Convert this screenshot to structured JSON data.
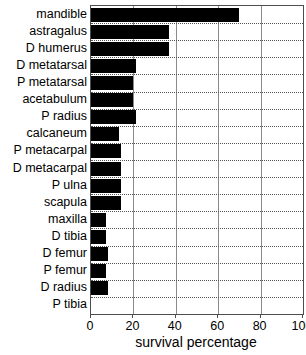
{
  "chart_data": {
    "type": "bar",
    "orientation": "horizontal",
    "title": "",
    "xlabel": "survival percentage",
    "ylabel": "",
    "xlim": [
      0,
      100
    ],
    "xticks": [
      0,
      20,
      40,
      60,
      80,
      100
    ],
    "grid": "vertical solid, horizontal dotted",
    "legend": "none",
    "bar_color": "#000000",
    "categories": [
      "mandible",
      "astragalus",
      "D humerus",
      "D metatarsal",
      "P metatarsal",
      "acetabulum",
      "P radius",
      "calcaneum",
      "P metacarpal",
      "D metacarpal",
      "P ulna",
      "scapula",
      "maxilla",
      "D tibia",
      "D femur",
      "P femur",
      "D radius",
      "P tibia"
    ],
    "values": [
      70,
      37,
      37,
      21,
      20,
      20,
      21,
      13,
      14,
      14,
      14,
      14,
      7,
      7,
      8,
      7,
      8,
      0
    ]
  },
  "axis": {
    "x_title": "survival percentage",
    "tick_labels": [
      "0",
      "20",
      "40",
      "60",
      "80",
      "100"
    ]
  },
  "colors": {
    "bar": "#000000",
    "frame": "#4d4d4d",
    "vgrid": "#8a8a8a",
    "hgrid": "#555555",
    "background": "#ffffff"
  }
}
